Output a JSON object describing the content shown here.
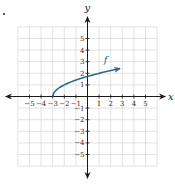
{
  "chart_data": {
    "type": "line",
    "title": "",
    "xlabel": "x",
    "ylabel": "y",
    "xlim": [
      -6,
      6
    ],
    "ylim": [
      -6,
      6
    ],
    "grid": true,
    "x_ticks": [
      -5,
      -4,
      -3,
      -2,
      -1,
      1,
      2,
      3,
      4,
      5
    ],
    "y_ticks": [
      5,
      4,
      3,
      2,
      1,
      -1,
      -2,
      -3,
      -4,
      -5
    ],
    "x_tick_labels": [
      "−5",
      "−4",
      "−3",
      "−2",
      "−1",
      "1",
      "2",
      "3",
      "4",
      "5"
    ],
    "y_tick_labels": [
      "5",
      "4",
      "3",
      "2",
      "1",
      "−1",
      "−2",
      "−3",
      "−4",
      "−5"
    ],
    "series": [
      {
        "name": "f",
        "label": "f",
        "color": "#2e6a8e",
        "function": "sqrt(x+3)",
        "x_start": -3,
        "x_end": 2.8,
        "arrow_at_end": true,
        "points": [
          [
            -3,
            0
          ],
          [
            -2.75,
            0.5
          ],
          [
            -2,
            1
          ],
          [
            -1,
            1.41
          ],
          [
            0,
            1.73
          ],
          [
            1,
            2
          ],
          [
            2,
            2.24
          ],
          [
            2.8,
            2.41
          ]
        ]
      }
    ]
  },
  "colors": {
    "grid": "#d9d9d9",
    "axis": "#1a1a1a",
    "curve": "#2e6a8e",
    "label": "#2e6a8e"
  }
}
